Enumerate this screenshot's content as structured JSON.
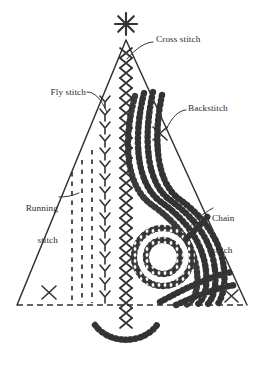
{
  "diagram": {
    "colors": {
      "ink": "#333333",
      "background": "#ffffff",
      "stitch_fill": "#ffffff"
    },
    "labels": [
      {
        "id": "cross-stitch",
        "text": "Cross stitch",
        "lines": [
          "Cross stitch"
        ],
        "align": "left",
        "x": 156,
        "y": 39,
        "leader": {
          "from_x": 152,
          "from_y": 45,
          "to_x": 124,
          "to_y": 60
        }
      },
      {
        "id": "fly-stitch",
        "text": "Fly stitch",
        "lines": [
          "Fly stitch"
        ],
        "align": "right",
        "x": 45,
        "y": 92,
        "leader": {
          "from_x": 97,
          "from_y": 97,
          "to_x": 109,
          "to_y": 112
        }
      },
      {
        "id": "backstitch",
        "text": "Backstitch",
        "lines": [
          "Backstitch"
        ],
        "align": "left",
        "x": 188,
        "y": 108,
        "leader": {
          "from_x": 184,
          "from_y": 113,
          "to_x": 168,
          "to_y": 128
        }
      },
      {
        "id": "running-stitch",
        "text": "Running stitch",
        "lines": [
          "Running",
          "stitch"
        ],
        "align": "right",
        "x": 14,
        "y": 186,
        "leader": {
          "from_x": 62,
          "from_y": 202,
          "to_x": 76,
          "to_y": 196
        }
      },
      {
        "id": "chain-stitch",
        "text": "Chain stitch",
        "lines": [
          "Chain",
          "stitch"
        ],
        "align": "left",
        "x": 212,
        "y": 196,
        "leader": {
          "from_x": 210,
          "from_y": 212,
          "to_x": 186,
          "to_y": 226
        }
      }
    ],
    "elements": {
      "tree_outline": {
        "apex_x": 126,
        "apex_y": 39,
        "left_x": 17,
        "right_x": 247,
        "base_y": 305
      },
      "star": {
        "cx": 126,
        "cy": 24,
        "rays": 8,
        "radius": 11
      },
      "baseline": {
        "style": "dashed",
        "x1": 17,
        "x2": 247,
        "y": 305
      },
      "cross_stitch_column": {
        "x": 126,
        "y_start": 52,
        "y_end": 332,
        "count": 28,
        "glyph": "X"
      },
      "fly_stitch_column": {
        "x": 105,
        "y_start": 96,
        "y_end": 300,
        "count": 16,
        "glyph": "Y"
      },
      "running_stitch_lines": {
        "xs": [
          72,
          82,
          92
        ],
        "y_start": 152,
        "y_end": 303,
        "dash": "4 5"
      },
      "chain_spiral": {
        "cx": 163,
        "cy": 257,
        "turns": 2
      },
      "ornaments": [
        {
          "id": "ornament-left",
          "x": 49,
          "y": 292,
          "glyph": "X"
        },
        {
          "id": "ornament-mid",
          "x": 160,
          "y": 133,
          "glyph": "X"
        },
        {
          "id": "ornament-right",
          "x": 231,
          "y": 296,
          "glyph": "X"
        }
      ],
      "tree_stand_arc": {
        "cx": 126,
        "cy": 322,
        "radius": 33
      }
    }
  }
}
